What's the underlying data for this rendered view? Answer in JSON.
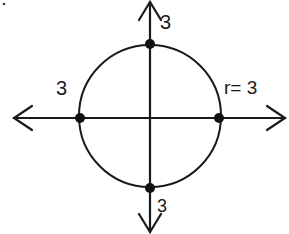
{
  "diagram": {
    "type": "circle-on-axes",
    "circle": {
      "center": [
        0,
        0
      ],
      "radius": 3
    },
    "labels": {
      "top": "3",
      "left": "3",
      "bottom": "3",
      "radius": "r= 3"
    },
    "points": [
      {
        "name": "top",
        "coord": [
          0,
          3
        ]
      },
      {
        "name": "left",
        "coord": [
          -3,
          0
        ]
      },
      {
        "name": "right",
        "coord": [
          3,
          0
        ]
      },
      {
        "name": "bottom",
        "coord": [
          0,
          -3
        ]
      }
    ],
    "colors": {
      "stroke": "#1a1a1a",
      "background": "#ffffff"
    }
  }
}
